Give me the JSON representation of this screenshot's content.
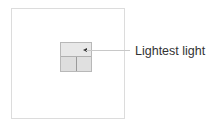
{
  "diagram": {
    "callout_label": "Lightest light",
    "elements": {
      "outer_frame": "outer-frame",
      "grid_cells": [
        "top",
        "bottom-left",
        "bottom-right"
      ],
      "pointer_target": "top-cell"
    },
    "colors": {
      "frame_border": "#dcdcdc",
      "cell_fill": "#e6e6e6",
      "leader_line": "#c8c8c8",
      "text": "#333333"
    }
  }
}
